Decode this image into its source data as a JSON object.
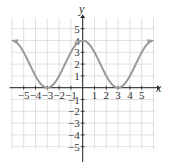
{
  "chart_data": {
    "type": "line",
    "title": "",
    "xlabel": "x",
    "ylabel": "y",
    "xlim": [
      -6,
      6
    ],
    "ylim": [
      -6,
      6
    ],
    "grid": true,
    "x_ticks": [
      -5,
      -4,
      -3,
      -2,
      -1,
      1,
      2,
      3,
      4,
      5
    ],
    "x_tick_labels": [
      "−5",
      "−4",
      "−3",
      "−2",
      "−1",
      "1",
      "2",
      "3",
      "4",
      "5"
    ],
    "y_ticks": [
      5,
      4,
      3,
      2,
      1,
      -1,
      -2,
      -3,
      -4,
      -5
    ],
    "y_tick_labels": [
      "5",
      "4",
      "3",
      "2",
      "1",
      "−1",
      "−2",
      "−3",
      "−4",
      "−5"
    ],
    "series": [
      {
        "name": "curve",
        "color": "#9a9a9a",
        "arrows_both_ends": true,
        "description": "smooth curve with minima at (-3,0) and (3,0), maximum at (0,4), rising toward upper-left and upper-right",
        "x": [
          -5.9,
          -5,
          -4,
          -3,
          -2,
          -1,
          0,
          1,
          2,
          3,
          4,
          5,
          5.9
        ],
        "y": [
          3.9,
          3.0,
          1.0,
          0.0,
          1.0,
          3.0,
          4.0,
          3.0,
          1.0,
          0.0,
          1.0,
          3.0,
          3.9
        ]
      }
    ]
  },
  "colors": {
    "grid": "#d9d9d9",
    "axis": "#222222",
    "curve": "#9a9a9a"
  }
}
